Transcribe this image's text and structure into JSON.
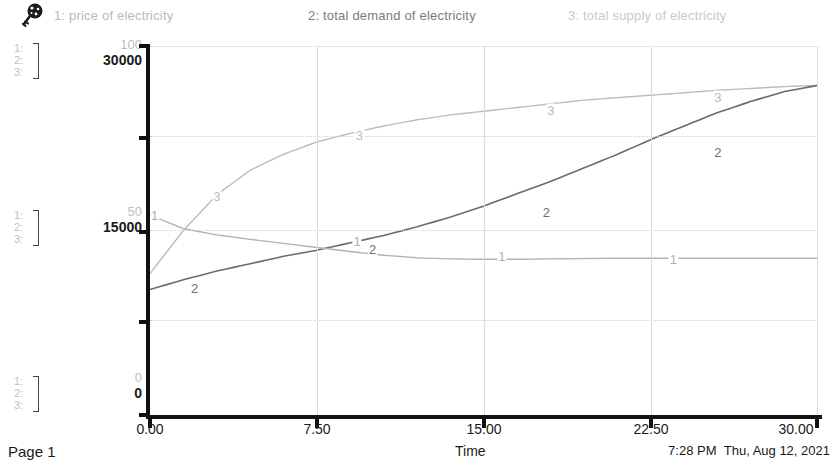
{
  "header": {
    "icon": "key-icon",
    "legend": [
      {
        "num": "1",
        "label": "1: price of electricity",
        "color": "#b9b9b9"
      },
      {
        "num": "2",
        "label": "2: total demand of electricity",
        "color": "#7b7b7b"
      },
      {
        "num": "3",
        "label": "3: total supply of electricity",
        "color": "#c9c9c9"
      }
    ]
  },
  "axis_stacks": {
    "scale_1": "1:",
    "scale_2": "2:",
    "scale_3": "3:"
  },
  "y_labels": {
    "top": {
      "scale1": "100",
      "scale23": "30000"
    },
    "middle": {
      "scale1": "50",
      "scale23": "15000"
    },
    "bottom": {
      "scale1": "0",
      "scale23": "0"
    }
  },
  "x_labels": [
    "0.00",
    "7.50",
    "15.00",
    "22.50",
    "30.00"
  ],
  "x_title": "Time",
  "footer": {
    "page": "Page 1",
    "time": "7:28 PM",
    "date": "Thu, Aug 12, 2021"
  },
  "chart_data": {
    "type": "line",
    "title": "",
    "subtitle": "",
    "xlabel": "Time",
    "ylabel": "",
    "xlim": [
      0,
      30
    ],
    "xticks": [
      0,
      7.5,
      15,
      22.5,
      30
    ],
    "grid": true,
    "legend_position": "top",
    "axes": [
      {
        "id": 1,
        "name": "price of electricity",
        "ylim": [
          0,
          100
        ],
        "yticks": [
          0,
          50,
          100
        ]
      },
      {
        "id": 2,
        "name": "total demand of electricity",
        "ylim": [
          0,
          30000
        ],
        "yticks": [
          0,
          15000,
          30000
        ]
      },
      {
        "id": 3,
        "name": "total supply of electricity",
        "ylim": [
          0,
          30000
        ],
        "yticks": [
          0,
          15000,
          30000
        ]
      }
    ],
    "x": [
      0,
      1.5,
      3,
      4.5,
      6,
      7.5,
      9,
      10.5,
      12,
      13.5,
      15,
      16.5,
      18,
      19.5,
      21,
      22.5,
      24,
      25.5,
      27,
      28.5,
      30
    ],
    "series": [
      {
        "name": "1: price of electricity",
        "axis": 1,
        "color": "#b3b3b3",
        "values": [
          54.2,
          50.5,
          48.8,
          47.6,
          46.5,
          45.4,
          44.3,
          43.3,
          42.6,
          42.3,
          42.2,
          42.2,
          42.3,
          42.4,
          42.5,
          42.5,
          42.5,
          42.5,
          42.5,
          42.5,
          42.5
        ]
      },
      {
        "name": "2: total demand of electricity",
        "axis": 2,
        "color": "#6b6b6b",
        "values": [
          10200,
          11000,
          11700,
          12300,
          12900,
          13400,
          14000,
          14600,
          15300,
          16100,
          17000,
          18000,
          19000,
          20100,
          21200,
          22400,
          23500,
          24600,
          25500,
          26300,
          26800
        ]
      },
      {
        "name": "3: total supply of electricity",
        "axis": 3,
        "color": "#bcbcbc",
        "values": [
          11500,
          15000,
          17900,
          19900,
          21200,
          22200,
          22900,
          23500,
          24000,
          24400,
          24700,
          25000,
          25300,
          25600,
          25800,
          26000,
          26200,
          26400,
          26550,
          26700,
          26800
        ]
      }
    ],
    "inline_labels": [
      {
        "series": "1",
        "x": 0.2,
        "y_px": 215
      },
      {
        "series": "1",
        "x": 9.3,
        "y_px": 241
      },
      {
        "series": "1",
        "x": 15.8,
        "y_px": 256
      },
      {
        "series": "1",
        "x": 23.5,
        "y_px": 259
      },
      {
        "series": "2",
        "x": 2.0,
        "y_px": 288
      },
      {
        "series": "2",
        "x": 10.0,
        "y_px": 249
      },
      {
        "series": "2",
        "x": 17.8,
        "y_px": 212
      },
      {
        "series": "2",
        "x": 25.5,
        "y_px": 152
      },
      {
        "series": "3",
        "x": 3.0,
        "y_px": 196
      },
      {
        "series": "3",
        "x": 9.4,
        "y_px": 135
      },
      {
        "series": "3",
        "x": 18.0,
        "y_px": 110
      },
      {
        "series": "3",
        "x": 25.5,
        "y_px": 97
      }
    ]
  }
}
